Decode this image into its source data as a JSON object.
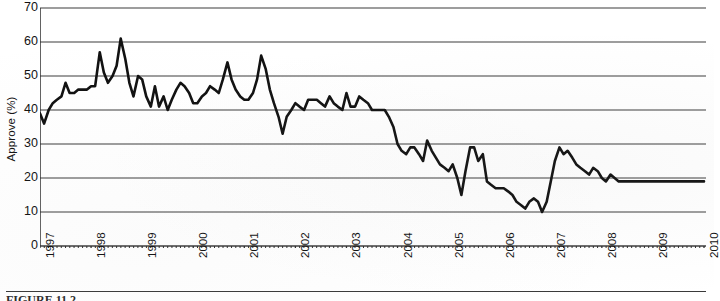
{
  "figure": {
    "caption_partial": "FIGURE 11.2",
    "y_axis_title": "Approve (%)"
  },
  "chart_data": {
    "type": "line",
    "title": "",
    "xlabel": "",
    "ylabel": "Approve (%)",
    "ylim": [
      0,
      70
    ],
    "xlim": [
      1997.0,
      2010.0
    ],
    "ytick_labels": [
      "70",
      "60",
      "50",
      "40",
      "30",
      "20",
      "10",
      "0"
    ],
    "yticks": [
      70,
      60,
      50,
      40,
      30,
      20,
      10,
      0
    ],
    "xtick_labels": [
      "1997",
      "1998",
      "1999",
      "2000",
      "2001",
      "2002",
      "2003",
      "2004",
      "2005",
      "2006",
      "2007",
      "2008",
      "2009",
      "2010"
    ],
    "xticks": [
      1997,
      1998,
      1999,
      2000,
      2001,
      2002,
      2003,
      2004,
      2005,
      2006,
      2007,
      2008,
      2009,
      2010
    ],
    "grid": "horizontal",
    "legend": "none",
    "minor_tick_interval_months": 1,
    "line_color": "#111111",
    "line_width": 2.6,
    "series": [
      {
        "name": "Approve",
        "x": [
          1997.0,
          1997.08,
          1997.17,
          1997.25,
          1997.33,
          1997.42,
          1997.5,
          1997.58,
          1997.67,
          1997.75,
          1997.83,
          1997.92,
          1998.0,
          1998.08,
          1998.17,
          1998.25,
          1998.33,
          1998.42,
          1998.5,
          1998.58,
          1998.67,
          1998.75,
          1998.83,
          1998.92,
          1999.0,
          1999.08,
          1999.17,
          1999.25,
          1999.33,
          1999.42,
          1999.5,
          1999.58,
          1999.67,
          1999.75,
          1999.83,
          1999.92,
          2000.0,
          2000.08,
          2000.17,
          2000.25,
          2000.33,
          2000.42,
          2000.5,
          2000.58,
          2000.67,
          2000.75,
          2000.83,
          2000.92,
          2001.0,
          2001.08,
          2001.17,
          2001.25,
          2001.33,
          2001.42,
          2001.5,
          2001.58,
          2001.67,
          2001.75,
          2001.83,
          2001.92,
          2002.0,
          2002.08,
          2002.17,
          2002.25,
          2002.33,
          2002.42,
          2002.5,
          2002.58,
          2002.67,
          2002.75,
          2002.83,
          2002.92,
          2003.0,
          2003.08,
          2003.17,
          2003.25,
          2003.33,
          2003.42,
          2003.5,
          2003.58,
          2003.67,
          2003.75,
          2003.83,
          2003.92,
          2004.0,
          2004.08,
          2004.17,
          2004.25,
          2004.33,
          2004.42,
          2004.5,
          2004.58,
          2004.67,
          2004.75,
          2004.83,
          2004.92,
          2005.0,
          2005.08,
          2005.17,
          2005.25,
          2005.33,
          2005.42,
          2005.5,
          2005.58,
          2005.67,
          2005.75,
          2005.83,
          2005.92,
          2006.0,
          2006.08,
          2006.17,
          2006.25,
          2006.33,
          2006.42,
          2006.5,
          2006.58,
          2006.67,
          2006.75,
          2006.83,
          2006.92,
          2007.0,
          2007.08,
          2007.17,
          2007.25,
          2007.33,
          2007.42,
          2007.5,
          2007.58,
          2007.67,
          2007.75,
          2007.83,
          2007.92,
          2008.0,
          2008.08,
          2008.17,
          2008.25,
          2008.33,
          2008.42,
          2008.5,
          2008.58,
          2008.67,
          2008.75,
          2008.83,
          2008.92,
          2009.0,
          2009.08,
          2009.17,
          2009.25,
          2009.33,
          2009.42,
          2009.5,
          2009.58,
          2009.67,
          2009.75,
          2009.83,
          2009.92,
          2010.0
        ],
        "values": [
          39,
          36,
          40,
          42,
          43,
          44,
          48,
          45,
          45,
          46,
          46,
          46,
          47,
          47,
          57,
          51,
          48,
          50,
          53,
          61,
          55,
          48,
          44,
          50,
          49,
          44,
          41,
          47,
          41,
          44,
          40,
          43,
          46,
          48,
          47,
          45,
          42,
          42,
          44,
          45,
          47,
          46,
          45,
          49,
          54,
          49,
          46,
          44,
          43,
          43,
          45,
          49,
          56,
          52,
          46,
          42,
          38,
          33,
          38,
          40,
          42,
          41,
          40,
          43,
          43,
          43,
          42,
          41,
          44,
          42,
          41,
          40,
          45,
          41,
          41,
          44,
          43,
          42,
          40,
          40,
          40,
          40,
          38,
          35,
          30,
          28,
          27,
          29,
          29,
          27,
          25,
          31,
          28,
          26,
          24,
          23,
          22,
          24,
          20,
          15,
          22,
          29,
          29,
          25,
          27,
          19,
          18,
          17,
          17,
          17,
          16,
          15,
          13,
          12,
          11,
          13,
          14,
          13,
          10,
          13,
          19,
          25,
          29,
          27,
          28,
          26,
          24,
          23,
          22,
          21,
          23,
          22,
          20,
          19,
          21,
          20,
          19,
          19,
          19,
          19,
          19,
          19,
          19,
          19,
          19,
          19,
          19,
          19,
          19,
          19,
          19,
          19,
          19,
          19,
          19,
          19,
          19
        ]
      }
    ]
  }
}
